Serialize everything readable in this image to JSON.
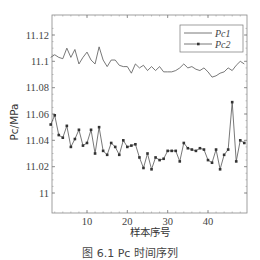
{
  "chart_data": {
    "type": "line",
    "title": "",
    "xlabel": "样本序号",
    "ylabel": "Pc/MPa",
    "xlim": [
      1,
      49
    ],
    "ylim": [
      10.995,
      11.135
    ],
    "x_ticks": [
      10,
      20,
      30,
      40
    ],
    "y_ticks": [
      11,
      11.02,
      11.04,
      11.06,
      11.08,
      11.1,
      11.12
    ],
    "y_tick_labels": [
      "11",
      "11.02",
      "11.04",
      "11.06",
      "11.08",
      "11.1",
      "11.12"
    ],
    "grid": false,
    "legend_position": "upper right",
    "x": [
      1,
      2,
      3,
      4,
      5,
      6,
      7,
      8,
      9,
      10,
      11,
      12,
      13,
      14,
      15,
      16,
      17,
      18,
      19,
      20,
      21,
      22,
      23,
      24,
      25,
      26,
      27,
      28,
      29,
      30,
      31,
      32,
      33,
      34,
      35,
      36,
      37,
      38,
      39,
      40,
      41,
      42,
      43,
      44,
      45,
      46,
      47,
      48,
      49
    ],
    "series": [
      {
        "name": "Pc1",
        "marker": "none",
        "values": [
          11.103,
          11.105,
          11.103,
          11.102,
          11.11,
          11.103,
          11.109,
          11.098,
          11.103,
          11.107,
          11.101,
          11.098,
          11.111,
          11.101,
          11.096,
          11.101,
          11.101,
          11.097,
          11.096,
          11.096,
          11.091,
          11.098,
          11.095,
          11.097,
          11.093,
          11.096,
          11.093,
          11.096,
          11.092,
          11.092,
          11.092,
          11.093,
          11.095,
          11.098,
          11.095,
          11.096,
          11.094,
          11.093,
          11.095,
          11.092,
          11.088,
          11.089,
          11.091,
          11.092,
          11.095,
          11.093,
          11.097,
          11.1,
          11.098
        ]
      },
      {
        "name": "Pc2",
        "marker": "square",
        "values": [
          11.052,
          11.059,
          11.044,
          11.042,
          11.051,
          11.035,
          11.041,
          11.048,
          11.036,
          11.038,
          11.048,
          11.03,
          11.05,
          11.032,
          11.029,
          11.038,
          11.035,
          11.029,
          11.04,
          11.035,
          11.036,
          11.037,
          11.027,
          11.019,
          11.03,
          11.018,
          11.027,
          11.025,
          11.026,
          11.032,
          11.032,
          11.032,
          11.024,
          11.038,
          11.034,
          11.033,
          11.032,
          11.034,
          11.033,
          11.025,
          11.023,
          11.033,
          11.018,
          11.029,
          11.033,
          11.069,
          11.024,
          11.04,
          11.038
        ]
      }
    ]
  },
  "legend": {
    "items": [
      {
        "label": "Pc1"
      },
      {
        "label": "Pc2"
      }
    ]
  },
  "caption": "图 6.1   Pc 时间序列",
  "colors": {
    "line": "#555555",
    "axis": "#777777",
    "background": "#ffffff"
  }
}
